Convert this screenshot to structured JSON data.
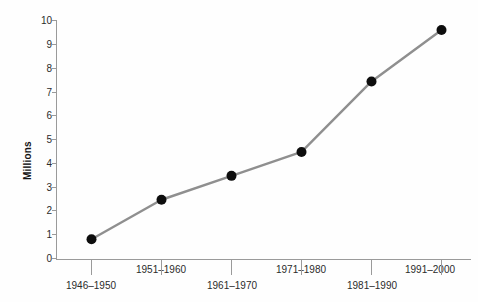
{
  "chart_data": {
    "type": "line",
    "title": "",
    "xlabel": "",
    "ylabel": "Millions",
    "categories": [
      "1946–1950",
      "1951–1960",
      "1961–1970",
      "1971–1980",
      "1981–1990",
      "1991–2000"
    ],
    "values": [
      0.85,
      2.5,
      3.5,
      4.5,
      7.45,
      9.6
    ],
    "series": [
      {
        "name": "Millions",
        "values": [
          0.85,
          2.5,
          3.5,
          4.5,
          7.45,
          9.6
        ]
      }
    ],
    "ylim": [
      0,
      10
    ],
    "yticks": [
      0,
      1,
      2,
      3,
      4,
      5,
      6,
      7,
      8,
      9,
      10
    ],
    "ytick_labels": [
      "0",
      "1",
      "2",
      "3",
      "4",
      "5",
      "6",
      "7",
      "8",
      "9",
      "10"
    ],
    "grid": false,
    "legend": false,
    "legend_position": "none",
    "xtick_labels_staggered": true,
    "marker": "circle",
    "colors": {
      "line": "#8f8f8f",
      "marker": "#0d0d0d",
      "axis": "#9a9a9a",
      "tick_text": "#2b2b2b",
      "axis_title": "#131313",
      "background": "#fefefe"
    }
  }
}
